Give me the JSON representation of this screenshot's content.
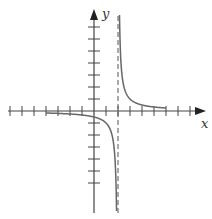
{
  "figure": {
    "axis_labels": {
      "x": "x",
      "y": "y"
    },
    "function": "y = 1/(x - 2)",
    "vertical_asymptote": 2,
    "horizontal_asymptote": 0,
    "x_ticks": [
      -7,
      -6,
      -5,
      -4,
      -3,
      -2,
      -1,
      1,
      2,
      3,
      4,
      5,
      6,
      7,
      8
    ],
    "y_ticks": [
      -6,
      -5,
      -4,
      -3,
      -2,
      -1,
      1,
      2,
      3,
      4,
      5,
      6,
      7
    ],
    "colors": {
      "axis": "#444444",
      "curve": "#666666",
      "asymptote": "#555555"
    }
  }
}
